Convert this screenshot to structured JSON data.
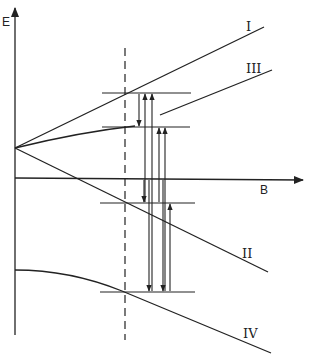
{
  "diagram": {
    "type": "energy-level-diagram",
    "axes": {
      "y_label": "E",
      "x_label": "B"
    },
    "levels": [
      {
        "id": "I",
        "label": "I",
        "description": "upper level, increasing linearly with B"
      },
      {
        "id": "II",
        "label": "II",
        "description": "level decreasing linearly with B"
      },
      {
        "id": "III",
        "label": "III",
        "description": "level curving upward, increasing with B"
      },
      {
        "id": "IV",
        "label": "IV",
        "description": "lowest level, curving downward with B"
      }
    ],
    "marker": "dashed vertical line at fixed field B",
    "transitions": {
      "description": "vertical arrows between horizontal level markers at the dashed field value",
      "count_up": 4,
      "count_down": 4
    },
    "colors": {
      "line": "#222222",
      "background": "#ffffff"
    }
  }
}
